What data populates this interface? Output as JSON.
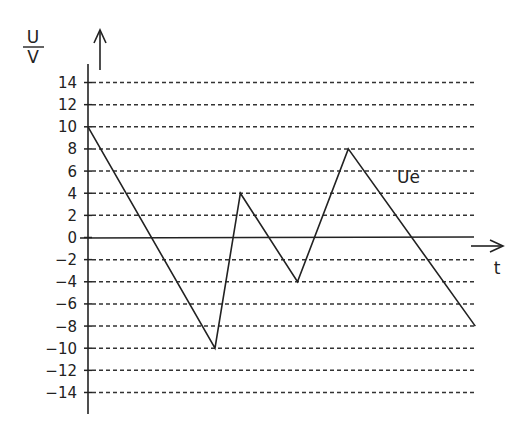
{
  "chart_data": {
    "type": "line",
    "title": "",
    "xlabel": "t",
    "ylabel": "U / V",
    "ylabel_numerator": "U",
    "ylabel_denominator": "V",
    "ylim": [
      -14,
      14
    ],
    "yticks": [
      14,
      12,
      10,
      8,
      6,
      4,
      2,
      0,
      -2,
      -4,
      -6,
      -8,
      -10,
      -12,
      -14
    ],
    "ytick_labels": [
      "14",
      "12",
      "10",
      "8",
      "6",
      "4",
      "2",
      "0",
      "-2",
      "-4",
      "-6",
      "-8",
      "-10",
      "-12",
      "-14"
    ],
    "grid": "horizontal dashed lines at every y tick",
    "series": [
      {
        "name": "Ue",
        "label": "Ue",
        "x": [
          0,
          1,
          1.2,
          1.65,
          2.05,
          3.05
        ],
        "values": [
          10,
          -10,
          4,
          -4,
          8,
          -8
        ]
      }
    ],
    "xaxis_ticks": "none (time axis unlabeled)",
    "legend": "inline label 'Ue' beside falling segment"
  }
}
